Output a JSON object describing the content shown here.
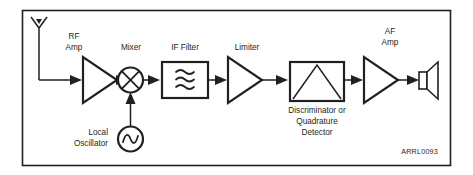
{
  "figure": {
    "credit_label": "ARRL0093",
    "border_color": "#231f20",
    "line_color": "#231f20",
    "background_color": "#ffffff"
  },
  "labels": {
    "rf_amp_line1": "RF",
    "rf_amp_line2": "Amp",
    "mixer": "Mixer",
    "if_filter": "IF Filter",
    "limiter": "Limiter",
    "af_amp_line1": "AF",
    "af_amp_line2": "Amp",
    "local_osc_line1": "Local",
    "local_osc_line2": "Oscillator",
    "discriminator_line1": "Discriminator or",
    "discriminator_line2": "Quadrature",
    "discriminator_line3": "Detector"
  },
  "blocks": [
    {
      "id": "antenna",
      "name": "antenna-symbol",
      "label": ""
    },
    {
      "id": "rf-amp",
      "name": "rf-amplifier-block",
      "label": "RF Amp"
    },
    {
      "id": "mixer",
      "name": "mixer-block",
      "label": "Mixer"
    },
    {
      "id": "local-oscillator",
      "name": "local-oscillator-block",
      "label": "Local Oscillator"
    },
    {
      "id": "if-filter",
      "name": "if-filter-block",
      "label": "IF Filter"
    },
    {
      "id": "limiter",
      "name": "limiter-block",
      "label": "Limiter"
    },
    {
      "id": "discriminator",
      "name": "discriminator-block",
      "label": "Discriminator or Quadrature Detector"
    },
    {
      "id": "af-amp",
      "name": "af-amplifier-block",
      "label": "AF Amp"
    },
    {
      "id": "speaker",
      "name": "speaker-block",
      "label": ""
    }
  ],
  "signal_flow": [
    "antenna",
    "rf-amp",
    "mixer",
    "if-filter",
    "limiter",
    "discriminator",
    "af-amp",
    "speaker"
  ]
}
